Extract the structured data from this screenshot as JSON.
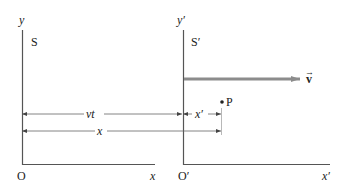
{
  "frame_s": {
    "name": "S",
    "y_axis_label": "y",
    "x_axis_label": "x",
    "origin_label": "O"
  },
  "frame_s_prime": {
    "name": "S′",
    "y_axis_label": "y′",
    "x_axis_label": "x′",
    "origin_label": "O′"
  },
  "velocity": {
    "label": "v",
    "arrow_color": "#8c8c8c"
  },
  "point": {
    "label": "P"
  },
  "dimensions": {
    "vt_label": "vt",
    "x_prime_label": "x′",
    "x_label": "x"
  },
  "colors": {
    "axis": "#555555",
    "dim_line": "#666666",
    "text": "#222222"
  }
}
